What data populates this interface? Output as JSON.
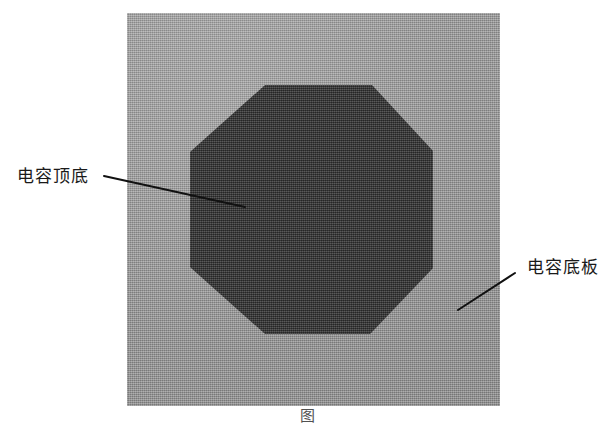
{
  "figure": {
    "domain_note": "scanned grayscale technical illustration of a capacitor plate structure",
    "caption": "图",
    "panel": {
      "name": "capacitor-substrate-panel",
      "color": "#969696"
    },
    "octagon": {
      "name": "capacitor-octagonal-plate",
      "color": "#3a3a3a"
    },
    "annotations": [
      {
        "id": "top-bottom",
        "label": "电容顶底",
        "leader": {
          "x1": 104,
          "y1": 176,
          "x2": 245,
          "y2": 207
        }
      },
      {
        "id": "base-plate",
        "label": "电容底板",
        "leader": {
          "x1": 458,
          "y1": 310,
          "x2": 515,
          "y2": 273
        }
      }
    ],
    "line_color": "#111111"
  }
}
